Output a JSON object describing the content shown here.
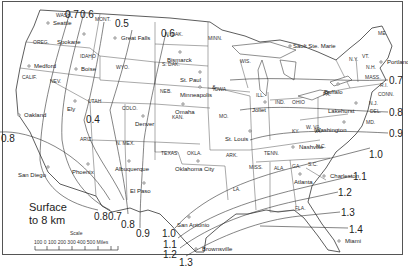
{
  "map": {
    "title_line1": "Surface",
    "title_line2": "to 8 km",
    "scale": {
      "title": "Scale",
      "ticks": "100  0  100  200  300  400  500 Miles"
    },
    "states": [
      {
        "name": "WASH.",
        "x": 56,
        "y": 17
      },
      {
        "name": "MONT.",
        "x": 95,
        "y": 21
      },
      {
        "name": "OREG.",
        "x": 33,
        "y": 44
      },
      {
        "name": "IDAHO",
        "x": 80,
        "y": 58
      },
      {
        "name": "WYO.",
        "x": 116,
        "y": 69
      },
      {
        "name": "CALIF.",
        "x": 22,
        "y": 79
      },
      {
        "name": "NEV.",
        "x": 50,
        "y": 83
      },
      {
        "name": "UTAH",
        "x": 88,
        "y": 103
      },
      {
        "name": "COLO.",
        "x": 122,
        "y": 110
      },
      {
        "name": "ARIZ.",
        "x": 80,
        "y": 141
      },
      {
        "name": "N. MEX.",
        "x": 116,
        "y": 145
      },
      {
        "name": "N. DAK.",
        "x": 165,
        "y": 36
      },
      {
        "name": "S. DAK.",
        "x": 162,
        "y": 66
      },
      {
        "name": "MINN.",
        "x": 208,
        "y": 40
      },
      {
        "name": "NEB.",
        "x": 160,
        "y": 93
      },
      {
        "name": "IOWA",
        "x": 213,
        "y": 91
      },
      {
        "name": "KAN.",
        "x": 172,
        "y": 119
      },
      {
        "name": "WIS.",
        "x": 240,
        "y": 63
      },
      {
        "name": "ILL.",
        "x": 256,
        "y": 97
      },
      {
        "name": "IND.",
        "x": 275,
        "y": 104
      },
      {
        "name": "OHIO",
        "x": 292,
        "y": 104
      },
      {
        "name": "MO.",
        "x": 219,
        "y": 118
      },
      {
        "name": "KY.",
        "x": 292,
        "y": 133
      },
      {
        "name": "TENN.",
        "x": 264,
        "y": 155
      },
      {
        "name": "OKLA.",
        "x": 187,
        "y": 155
      },
      {
        "name": "TEXAS",
        "x": 161,
        "y": 155
      },
      {
        "name": "ARK.",
        "x": 226,
        "y": 157
      },
      {
        "name": "LA.",
        "x": 233,
        "y": 191
      },
      {
        "name": "MISS.",
        "x": 249,
        "y": 169
      },
      {
        "name": "ALA.",
        "x": 274,
        "y": 170
      },
      {
        "name": "GA.",
        "x": 292,
        "y": 168
      },
      {
        "name": "S.C.",
        "x": 308,
        "y": 166
      },
      {
        "name": "N.C.",
        "x": 316,
        "y": 148
      },
      {
        "name": "VA.",
        "x": 314,
        "y": 133
      },
      {
        "name": "W. VA.",
        "x": 306,
        "y": 129
      },
      {
        "name": "PA.",
        "x": 323,
        "y": 96
      },
      {
        "name": "N.Y.",
        "x": 349,
        "y": 61
      },
      {
        "name": "VT.",
        "x": 362,
        "y": 58
      },
      {
        "name": "N.H.",
        "x": 366,
        "y": 69
      },
      {
        "name": "ME.",
        "x": 378,
        "y": 35
      },
      {
        "name": "MASS.",
        "x": 365,
        "y": 79
      },
      {
        "name": "R.I.",
        "x": 380,
        "y": 87
      },
      {
        "name": "CONN.",
        "x": 378,
        "y": 96
      },
      {
        "name": "N.J.",
        "x": 369,
        "y": 105
      },
      {
        "name": "DEL.",
        "x": 370,
        "y": 113
      },
      {
        "name": "MD.",
        "x": 366,
        "y": 124
      },
      {
        "name": "FLA.",
        "x": 295,
        "y": 210
      }
    ],
    "cities": [
      {
        "name": "Seattle",
        "x": 50,
        "y": 25,
        "dx": 2
      },
      {
        "name": "Spokane",
        "x": 84,
        "y": 36,
        "dx": -27
      },
      {
        "name": "Medford",
        "x": 31,
        "y": 68,
        "dx": 2
      },
      {
        "name": "Boise",
        "x": 78,
        "y": 71,
        "dx": 2
      },
      {
        "name": "Oakland",
        "x": 21,
        "y": 117,
        "dx": 2
      },
      {
        "name": "Ely",
        "x": 75,
        "y": 103,
        "dx": -8
      },
      {
        "name": "San Diego",
        "x": 48,
        "y": 169,
        "dx": -30
      },
      {
        "name": "Phoenix",
        "x": 88,
        "y": 166,
        "dx": -16
      },
      {
        "name": "Great Falls",
        "x": 117,
        "y": 40,
        "dx": 3
      },
      {
        "name": "Bismarck",
        "x": 180,
        "y": 54,
        "dx": -13
      },
      {
        "name": "St. Paul",
        "x": 200,
        "y": 74,
        "dx": -20
      },
      {
        "name": "&",
        "x": 218,
        "y": 81,
        "dx": -6
      },
      {
        "name": "Minneapolis",
        "x": 200,
        "y": 89,
        "dx": -20
      },
      {
        "name": "Denver",
        "x": 143,
        "y": 118,
        "dx": -8
      },
      {
        "name": "Omaha",
        "x": 183,
        "y": 106,
        "dx": -8
      },
      {
        "name": "Joliet",
        "x": 265,
        "y": 104,
        "dx": -13
      },
      {
        "name": "St. Louis",
        "x": 250,
        "y": 133,
        "dx": -25
      },
      {
        "name": "Albuquerque",
        "x": 129,
        "y": 163,
        "dx": -14
      },
      {
        "name": "El Paso",
        "x": 144,
        "y": 185,
        "dx": -14
      },
      {
        "name": "Oklahoma City",
        "x": 198,
        "y": 163,
        "dx": -23
      },
      {
        "name": "Nashville",
        "x": 295,
        "y": 149,
        "dx": 3
      },
      {
        "name": "Washington",
        "x": 344,
        "y": 124,
        "dx": -29
      },
      {
        "name": "Lakehurst",
        "x": 356,
        "y": 105,
        "dx": -28
      },
      {
        "name": "Buffalo",
        "x": 338,
        "y": 86,
        "dx": -14
      },
      {
        "name": "Sault Ste. Marie",
        "x": 292,
        "y": 48,
        "dx": 0
      },
      {
        "name": "Portland",
        "x": 383,
        "y": 64,
        "dx": 3
      },
      {
        "name": "Atlanta",
        "x": 300,
        "y": 176,
        "dx": -6
      },
      {
        "name": "Charleston",
        "x": 326,
        "y": 178,
        "dx": 3
      },
      {
        "name": "San Antonio",
        "x": 189,
        "y": 219,
        "dx": -12
      },
      {
        "name": "Brownsville",
        "x": 198,
        "y": 251,
        "dx": 3
      },
      {
        "name": "Miami",
        "x": 341,
        "y": 243,
        "dx": 3
      }
    ],
    "isolines": [
      {
        "value": "0.7",
        "x": 65,
        "y": 10
      },
      {
        "value": "0.6",
        "x": 80,
        "y": 10
      },
      {
        "value": "0.5",
        "x": 115,
        "y": 19
      },
      {
        "value": "0.6",
        "x": 161,
        "y": 29
      },
      {
        "value": "0.4",
        "x": 86,
        "y": 115
      },
      {
        "value": "0.8",
        "x": 1,
        "y": 134
      },
      {
        "value": "0.8",
        "x": 94,
        "y": 212
      },
      {
        "value": "0.7",
        "x": 108,
        "y": 212
      },
      {
        "value": "0.8",
        "x": 121,
        "y": 220
      },
      {
        "value": "0.9",
        "x": 136,
        "y": 229
      },
      {
        "value": "1.0",
        "x": 162,
        "y": 229
      },
      {
        "value": "1.1",
        "x": 163,
        "y": 240
      },
      {
        "value": "1.2",
        "x": 163,
        "y": 250
      },
      {
        "value": "1.3",
        "x": 179,
        "y": 258
      },
      {
        "value": "0.7",
        "x": 389,
        "y": 76
      },
      {
        "value": "0.8",
        "x": 389,
        "y": 108
      },
      {
        "value": "0.9",
        "x": 389,
        "y": 129
      },
      {
        "value": "1.0",
        "x": 369,
        "y": 150
      },
      {
        "value": "1.1",
        "x": 353,
        "y": 172
      },
      {
        "value": "1.2",
        "x": 338,
        "y": 188
      },
      {
        "value": "1.3",
        "x": 341,
        "y": 208
      },
      {
        "value": "1.4",
        "x": 349,
        "y": 225
      }
    ]
  }
}
